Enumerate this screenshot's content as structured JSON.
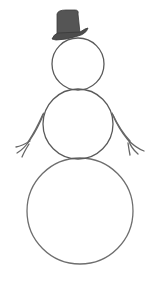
{
  "scene": {
    "subject": "snowman line drawing",
    "colors": {
      "background": "#ffffff",
      "outline": "#5a5a5a",
      "hat": "#505050",
      "arms": "#6a6a6a"
    },
    "parts": {
      "head": {
        "cx": 78,
        "cy": 64,
        "r": 26
      },
      "body": {
        "cx": 78,
        "cy": 124,
        "r": 35
      },
      "base": {
        "cx": 80,
        "cy": 211,
        "r": 53
      },
      "hat": "top-hat-icon",
      "left_arm": "stick-arm-icon",
      "right_arm": "stick-arm-icon"
    }
  }
}
